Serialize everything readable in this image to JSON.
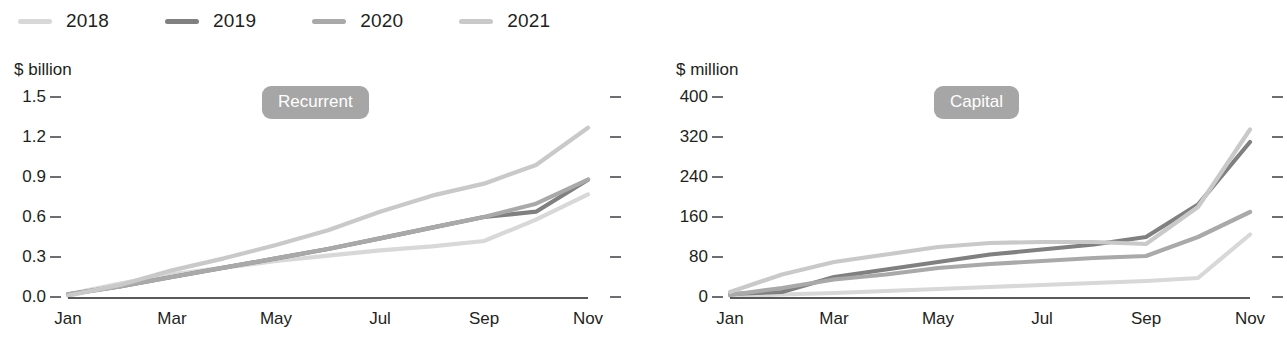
{
  "legend": {
    "items": [
      {
        "label": "2018",
        "color": "#d8d8d8"
      },
      {
        "label": "2019",
        "color": "#808080"
      },
      {
        "label": "2020",
        "color": "#a9a9a9"
      },
      {
        "label": "2021",
        "color": "#c9c9c9"
      }
    ]
  },
  "charts": [
    {
      "id": "recurrent",
      "badge": "Recurrent",
      "unit": "$ billion"
    },
    {
      "id": "capital",
      "badge": "Capital",
      "unit": "$ million"
    }
  ],
  "chart_data": [
    {
      "type": "line",
      "title": "Recurrent",
      "xlabel": "",
      "ylabel": "$ billion",
      "ylim": [
        0.0,
        1.5
      ],
      "yticks": [
        "0.0",
        "0.3",
        "0.6",
        "0.9",
        "1.2",
        "1.5"
      ],
      "ytick_values": [
        0.0,
        0.3,
        0.6,
        0.9,
        1.2,
        1.5
      ],
      "grid": false,
      "legend_position": "top-left-shared",
      "x": [
        "Jan",
        "Feb",
        "Mar",
        "Apr",
        "May",
        "Jun",
        "Jul",
        "Aug",
        "Sep",
        "Oct",
        "Nov"
      ],
      "xticks": [
        "Jan",
        "Mar",
        "May",
        "Jul",
        "Sep",
        "Nov"
      ],
      "series": [
        {
          "name": "2018",
          "color": "#d8d8d8",
          "values": [
            0.02,
            0.1,
            0.17,
            0.22,
            0.27,
            0.31,
            0.35,
            0.38,
            0.42,
            0.58,
            0.77
          ]
        },
        {
          "name": "2019",
          "color": "#808080",
          "values": [
            0.02,
            0.08,
            0.15,
            0.22,
            0.29,
            0.36,
            0.44,
            0.52,
            0.6,
            0.64,
            0.88
          ]
        },
        {
          "name": "2020",
          "color": "#a9a9a9",
          "values": [
            0.02,
            0.08,
            0.15,
            0.22,
            0.29,
            0.36,
            0.44,
            0.52,
            0.6,
            0.7,
            0.88
          ]
        },
        {
          "name": "2021",
          "color": "#c9c9c9",
          "values": [
            0.01,
            0.09,
            0.2,
            0.29,
            0.39,
            0.5,
            0.64,
            0.76,
            0.85,
            0.99,
            1.27
          ]
        }
      ]
    },
    {
      "type": "line",
      "title": "Capital",
      "xlabel": "",
      "ylabel": "$ million",
      "ylim": [
        0,
        400
      ],
      "yticks": [
        "0",
        "80",
        "160",
        "240",
        "320",
        "400"
      ],
      "ytick_values": [
        0,
        80,
        160,
        240,
        320,
        400
      ],
      "grid": false,
      "legend_position": "top-left-shared",
      "x": [
        "Jan",
        "Feb",
        "Mar",
        "Apr",
        "May",
        "Jun",
        "Jul",
        "Aug",
        "Sep",
        "Oct",
        "Nov"
      ],
      "xticks": [
        "Jan",
        "Mar",
        "May",
        "Jul",
        "Sep",
        "Nov"
      ],
      "series": [
        {
          "name": "2018",
          "color": "#d8d8d8",
          "values": [
            2,
            5,
            8,
            12,
            16,
            20,
            24,
            28,
            32,
            38,
            125
          ]
        },
        {
          "name": "2019",
          "color": "#808080",
          "values": [
            6,
            10,
            40,
            55,
            70,
            85,
            95,
            105,
            120,
            185,
            310
          ]
        },
        {
          "name": "2020",
          "color": "#a9a9a9",
          "values": [
            4,
            18,
            35,
            45,
            58,
            66,
            72,
            78,
            82,
            120,
            170
          ]
        },
        {
          "name": "2021",
          "color": "#c9c9c9",
          "values": [
            10,
            45,
            70,
            85,
            100,
            108,
            110,
            110,
            106,
            180,
            335
          ]
        }
      ]
    }
  ]
}
